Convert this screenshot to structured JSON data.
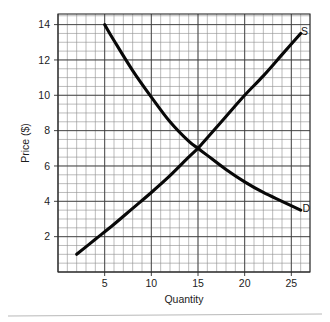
{
  "chart_data": {
    "type": "line",
    "title": "",
    "subtitle": "",
    "xlabel": "Quantity",
    "ylabel": "Price ($)",
    "xlim": [
      0,
      27
    ],
    "ylim": [
      0,
      14.6
    ],
    "grid": true,
    "grid_minor_step_x": 1,
    "grid_minor_step_y": 0.5,
    "grid_major_step_x": 5,
    "grid_major_step_y": 2,
    "legend_position": "inline-curve-end-labels",
    "xticks": [
      5,
      10,
      15,
      20,
      25
    ],
    "xtick_labels": [
      "5",
      "10",
      "15",
      "20",
      "25"
    ],
    "yticks": [
      2,
      4,
      6,
      8,
      10,
      12,
      14
    ],
    "ytick_labels": [
      "2",
      "4",
      "6",
      "8",
      "10",
      "12",
      "14"
    ],
    "annotations": [
      {
        "name": "supply-curve-label",
        "text": "S",
        "x": 26.4,
        "y": 13.6
      },
      {
        "name": "demand-curve-label",
        "text": "D",
        "x": 26.6,
        "y": 3.6
      }
    ],
    "equilibrium": {
      "quantity": 15,
      "price": 7
    },
    "series": [
      {
        "name": "S",
        "label": "Supply",
        "x": [
          2,
          4,
          6,
          8,
          10,
          12,
          14,
          15,
          16,
          18,
          20,
          22,
          24,
          26
        ],
        "y": [
          1.0,
          1.85,
          2.7,
          3.6,
          4.5,
          5.45,
          6.5,
          7.0,
          7.6,
          8.8,
          10.0,
          11.1,
          12.3,
          13.5
        ]
      },
      {
        "name": "D",
        "label": "Demand",
        "x": [
          5,
          6,
          8,
          10,
          12,
          14,
          15,
          16,
          18,
          20,
          22,
          24,
          26
        ],
        "y": [
          14.0,
          13.1,
          11.4,
          9.9,
          8.5,
          7.4,
          7.0,
          6.6,
          5.8,
          5.1,
          4.5,
          4.0,
          3.5
        ]
      }
    ]
  },
  "colors": {
    "curve": "#080808",
    "grid_minor": "#8f8f8f",
    "grid_major": "#3a3a3a",
    "border": "#2b2b2b",
    "background": "#ffffff",
    "text": "#1c1c1c"
  }
}
